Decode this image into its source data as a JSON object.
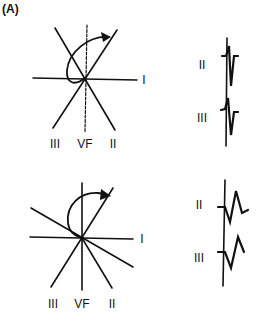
{
  "panel_label": "(A)",
  "top_diagram": {
    "axis_labels": {
      "I": "I",
      "III": "III",
      "VF": "VF",
      "II": "II"
    }
  },
  "top_ecg": {
    "leads": [
      "II",
      "III"
    ]
  },
  "bottom_diagram": {
    "axis_labels": {
      "I": "I",
      "III": "III",
      "VF": "VF",
      "II": "II"
    }
  },
  "bottom_ecg": {
    "leads": [
      "II",
      "III"
    ]
  },
  "colors": {
    "stroke": "#111111",
    "background": "#ffffff"
  }
}
